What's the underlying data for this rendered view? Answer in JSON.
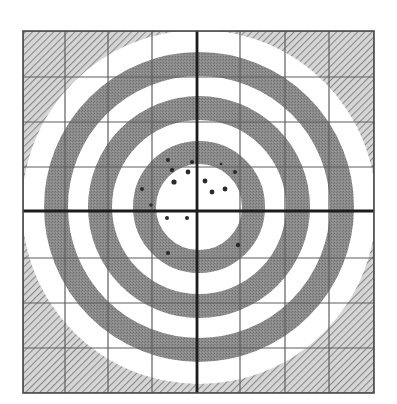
{
  "figure": {
    "kind": "shooting-target-grouping",
    "square": {
      "left": 23,
      "top": 31,
      "right": 374,
      "bottom": 393
    },
    "grid": {
      "vertical_x": [
        23,
        65,
        108,
        152,
        240,
        285,
        329,
        374
      ],
      "horizontal_y": [
        31,
        77,
        122,
        167,
        258,
        303,
        348,
        393
      ]
    },
    "crosshair": {
      "x": 197,
      "y": 211
    },
    "rings_center": {
      "x": 199,
      "y": 207
    },
    "white_disc_radius": 177,
    "gray_rings": [
      {
        "name": "outer-ring",
        "inner_radius": 131,
        "outer_radius": 155
      },
      {
        "name": "middle-ring",
        "inner_radius": 87,
        "outer_radius": 111
      },
      {
        "name": "inner-ring",
        "inner_radius": 43,
        "outer_radius": 66
      }
    ],
    "shots": [
      {
        "x": 168,
        "y": 160,
        "r": 2.0
      },
      {
        "x": 192,
        "y": 162,
        "r": 2.0
      },
      {
        "x": 172,
        "y": 170,
        "r": 2.2
      },
      {
        "x": 188,
        "y": 172,
        "r": 2.4
      },
      {
        "x": 174,
        "y": 182,
        "r": 2.6
      },
      {
        "x": 205,
        "y": 181,
        "r": 2.4
      },
      {
        "x": 212,
        "y": 192,
        "r": 2.4
      },
      {
        "x": 225,
        "y": 189,
        "r": 2.4
      },
      {
        "x": 235,
        "y": 172,
        "r": 2.0
      },
      {
        "x": 221,
        "y": 164,
        "r": 1.3
      },
      {
        "x": 142,
        "y": 189,
        "r": 2.0
      },
      {
        "x": 151,
        "y": 205,
        "r": 1.8
      },
      {
        "x": 167,
        "y": 218,
        "r": 2.0
      },
      {
        "x": 187,
        "y": 218,
        "r": 2.0
      },
      {
        "x": 238,
        "y": 245,
        "r": 2.2
      },
      {
        "x": 168,
        "y": 253,
        "r": 2.0
      }
    ],
    "colors": {
      "background": "#ffffff",
      "ring_gray": "#8c8c8c",
      "hatch_stroke": "#8a8a8a",
      "hatch_bg": "#d6d6d6",
      "shot": "#2a2a2a"
    }
  }
}
